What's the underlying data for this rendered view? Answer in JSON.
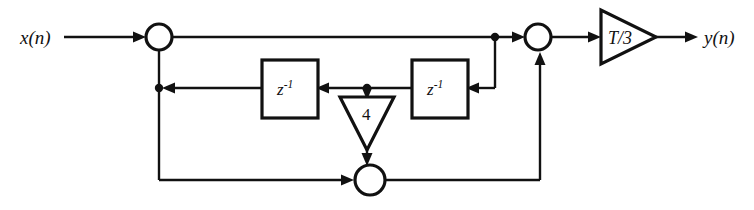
{
  "diagram": {
    "type": "signal-flow-diagram",
    "background_color": "#ffffff",
    "line_color": "#111111",
    "input": {
      "label": "x(n)",
      "position": "left"
    },
    "output": {
      "label": "y(n)",
      "position": "right"
    },
    "blocks": [
      {
        "id": "delay-left",
        "label": "z",
        "exponent": "-1",
        "full_label": "z^-1"
      },
      {
        "id": "delay-right",
        "label": "z",
        "exponent": "-1",
        "full_label": "z^-1"
      }
    ],
    "gains": [
      {
        "id": "gain-output",
        "label": "T/3",
        "orientation": "right"
      },
      {
        "id": "gain-feedback",
        "label": "4",
        "orientation": "down"
      }
    ],
    "adders": [
      {
        "id": "adder-input",
        "label": ""
      },
      {
        "id": "adder-output",
        "label": ""
      },
      {
        "id": "adder-feedback",
        "label": ""
      }
    ]
  }
}
